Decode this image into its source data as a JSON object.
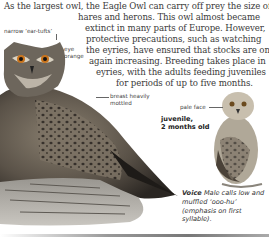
{
  "paragraph": {
    "lines": [
      "As the largest owl, the Eagle Owl can carry off prey the size of",
      "hares and herons. This owl almost became",
      "extinct in many parts of Europe. However,",
      "protective precautions, such as watching",
      "the eyries, have ensured that stocks are once",
      "again increasing. Breeding takes place in",
      "eyries, with the adults feeding juveniles",
      "for periods of up to five months."
    ]
  },
  "labels": {
    "ear_tufts": "narrow ‘ear-tufts’",
    "eye_line1": "eye",
    "eye_line2": "orange",
    "breast_line1": "breast heavily",
    "breast_line2": "mottled",
    "pale_face": "pale face",
    "juvenile_line1": "juvenile,",
    "juvenile_line2": "2 months old"
  },
  "voice": {
    "heading": "Voice",
    "text": "Male calls low and muffled ‘ooo-hu’ (emphasis on first syllable)."
  },
  "images": {
    "adult_owl": "eagle-owl-adult-illustration",
    "juvenile_owl": "eagle-owl-juvenile-illustration"
  }
}
